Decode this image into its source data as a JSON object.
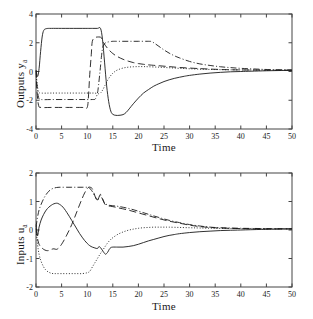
{
  "figure": {
    "background": "#ffffff",
    "line_color": "#1a1a1a",
    "axis_color": "#444444"
  },
  "chart_data": [
    {
      "type": "line",
      "id": "outputs",
      "title": "",
      "xlabel": "Time",
      "ylabel": "Outputs y",
      "ylabel_sub": "a",
      "xlim": [
        0,
        50
      ],
      "ylim": [
        -4,
        4
      ],
      "xticks": [
        0,
        5,
        10,
        15,
        20,
        25,
        30,
        35,
        40,
        45,
        50
      ],
      "yticks": [
        -4,
        -2,
        0,
        2,
        4
      ],
      "grid": false,
      "legend": "none",
      "series": [
        {
          "name": "output-1",
          "style": "solid",
          "x": [
            0,
            0.3,
            0.6,
            0.9,
            1.2,
            1.5,
            2,
            3,
            5,
            8,
            10,
            11,
            12,
            12.6,
            13,
            13.4,
            13.8,
            14.2,
            14.6,
            15,
            15.6,
            16.2,
            17,
            17.6,
            18.2,
            19,
            20,
            21,
            22,
            23,
            24,
            25,
            26,
            27,
            28,
            29,
            30,
            32,
            34,
            36,
            38,
            40,
            42,
            45,
            48,
            50
          ],
          "y": [
            0.1,
            -0.35,
            0.2,
            1.4,
            2.4,
            2.85,
            2.98,
            3.0,
            3.0,
            3.0,
            3.0,
            3.0,
            3.0,
            3.0,
            2.2,
            0.6,
            -1.0,
            -2.1,
            -2.75,
            -2.98,
            -3.05,
            -3.05,
            -3.0,
            -2.85,
            -2.6,
            -2.25,
            -1.85,
            -1.5,
            -1.25,
            -1.02,
            -0.85,
            -0.7,
            -0.58,
            -0.48,
            -0.4,
            -0.33,
            -0.27,
            -0.18,
            -0.11,
            -0.06,
            -0.02,
            0.0,
            0.02,
            0.05,
            0.07,
            0.08
          ]
        },
        {
          "name": "output-2",
          "style": "dashed",
          "x": [
            0,
            0.2,
            0.5,
            1,
            3,
            6,
            9,
            10,
            10.3,
            10.5,
            10.8,
            11,
            11.5,
            12,
            12.3,
            12.5,
            12.6,
            12.8,
            13.2,
            14,
            15,
            16,
            17,
            18,
            19,
            20,
            21,
            22,
            24,
            26,
            28,
            30,
            32,
            34,
            36,
            38,
            40,
            43,
            46,
            50
          ],
          "y": [
            0.05,
            -1.4,
            -2.35,
            -2.5,
            -2.5,
            -2.5,
            -2.5,
            -2.5,
            -1.4,
            -0.2,
            1.2,
            2.1,
            2.35,
            2.4,
            2.4,
            2.4,
            2.4,
            2.3,
            2.0,
            1.6,
            1.25,
            1.02,
            0.85,
            0.72,
            0.62,
            0.55,
            0.5,
            0.46,
            0.4,
            0.34,
            0.28,
            0.24,
            0.2,
            0.17,
            0.14,
            0.12,
            0.11,
            0.1,
            0.09,
            0.09
          ]
        },
        {
          "name": "output-3",
          "style": "dotted",
          "x": [
            0,
            0.2,
            0.5,
            1,
            3,
            6,
            9,
            10.5,
            11,
            11.4,
            11.8,
            12.2,
            12.6,
            13,
            13.5,
            14,
            14.5,
            15,
            15.5,
            16,
            17,
            18,
            19,
            20,
            21,
            22,
            24,
            26,
            28,
            30,
            33,
            36,
            40,
            45,
            50
          ],
          "y": [
            0.05,
            -0.8,
            -1.4,
            -1.5,
            -1.5,
            -1.5,
            -1.5,
            -1.5,
            -1.5,
            -1.5,
            -1.52,
            -1.55,
            -1.5,
            -1.3,
            -0.95,
            -0.6,
            -0.33,
            -0.12,
            0.02,
            0.12,
            0.24,
            0.3,
            0.33,
            0.34,
            0.34,
            0.33,
            0.3,
            0.26,
            0.22,
            0.19,
            0.15,
            0.13,
            0.11,
            0.1,
            0.09
          ]
        },
        {
          "name": "output-4",
          "style": "dashdot",
          "x": [
            0,
            0.2,
            0.5,
            1,
            3,
            6,
            9,
            11,
            11.6,
            12,
            12.2,
            12.5,
            12.8,
            13,
            13.2,
            13.6,
            14,
            14.6,
            15,
            16,
            18,
            20,
            22,
            22.6,
            23,
            24,
            25,
            26,
            27,
            28,
            30,
            32,
            34,
            36,
            38,
            40,
            43,
            46,
            50
          ],
          "y": [
            0.05,
            -1.0,
            -1.8,
            -1.95,
            -1.95,
            -1.95,
            -1.95,
            -1.95,
            -1.9,
            -1.5,
            -1.0,
            0.0,
            1.1,
            1.6,
            1.85,
            2.0,
            2.05,
            2.08,
            2.1,
            2.1,
            2.1,
            2.1,
            2.1,
            2.08,
            2.0,
            1.75,
            1.5,
            1.28,
            1.1,
            0.95,
            0.7,
            0.53,
            0.42,
            0.33,
            0.27,
            0.22,
            0.17,
            0.13,
            0.11
          ]
        }
      ]
    },
    {
      "type": "line",
      "id": "inputs",
      "title": "",
      "xlabel": "Time",
      "ylabel": "Inputs u",
      "ylabel_sub": "a",
      "xlim": [
        0,
        50
      ],
      "ylim": [
        -2,
        2
      ],
      "xticks": [
        0,
        5,
        10,
        15,
        20,
        25,
        30,
        35,
        40,
        45,
        50
      ],
      "yticks": [
        -2,
        -1,
        0,
        1,
        2
      ],
      "grid": false,
      "legend": "none",
      "series": [
        {
          "name": "input-1",
          "style": "solid",
          "x": [
            0,
            0.3,
            0.6,
            1,
            1.5,
            2,
            2.5,
            3,
            3.5,
            4,
            4.3,
            4.6,
            5,
            5.5,
            6,
            6.5,
            7,
            7.5,
            8,
            8.5,
            9,
            9.5,
            10,
            10.5,
            11,
            11.5,
            12,
            12.3,
            12.6,
            13,
            13.3,
            13.6,
            14,
            14.3,
            14.6,
            15,
            16,
            17,
            18,
            19,
            20,
            21,
            22,
            23,
            24,
            25,
            26,
            27,
            28,
            30,
            32,
            34,
            36,
            38,
            40,
            44,
            47,
            50
          ],
          "y": [
            0.2,
            -0.2,
            0.1,
            0.35,
            0.55,
            0.7,
            0.8,
            0.87,
            0.92,
            0.94,
            0.93,
            0.9,
            0.85,
            0.75,
            0.62,
            0.48,
            0.33,
            0.18,
            0.03,
            -0.12,
            -0.25,
            -0.37,
            -0.47,
            -0.55,
            -0.6,
            -0.63,
            -0.65,
            -0.58,
            -0.62,
            -0.72,
            -0.8,
            -0.85,
            -0.78,
            -0.68,
            -0.62,
            -0.6,
            -0.6,
            -0.6,
            -0.58,
            -0.55,
            -0.5,
            -0.44,
            -0.38,
            -0.33,
            -0.28,
            -0.23,
            -0.19,
            -0.16,
            -0.13,
            -0.09,
            -0.06,
            -0.04,
            -0.02,
            -0.01,
            0.0,
            0.02,
            0.03,
            0.04
          ]
        },
        {
          "name": "input-2",
          "style": "dashed",
          "x": [
            0,
            0.3,
            0.6,
            1,
            1.5,
            2,
            2.5,
            3,
            3.5,
            4,
            4.5,
            5,
            5.5,
            6,
            6.5,
            7,
            7.5,
            8,
            8.5,
            9,
            9.5,
            10,
            10.3,
            10.6,
            11,
            11.3,
            11.6,
            12,
            12.3,
            12.6,
            13,
            13.3,
            13.6,
            14,
            15,
            16,
            18,
            20,
            22,
            24,
            26,
            28,
            30,
            32,
            34,
            36,
            40,
            45,
            50
          ],
          "y": [
            0.05,
            -0.3,
            -0.5,
            -0.6,
            -0.68,
            -0.72,
            -0.72,
            -0.68,
            -0.66,
            -0.68,
            -0.62,
            -0.5,
            -0.35,
            -0.18,
            0.0,
            0.2,
            0.42,
            0.65,
            0.88,
            1.1,
            1.3,
            1.45,
            1.5,
            1.5,
            1.45,
            1.3,
            1.15,
            1.02,
            1.15,
            1.25,
            1.1,
            0.95,
            0.88,
            0.85,
            0.82,
            0.78,
            0.7,
            0.6,
            0.5,
            0.4,
            0.31,
            0.24,
            0.17,
            0.12,
            0.09,
            0.07,
            0.05,
            0.04,
            0.04
          ]
        },
        {
          "name": "input-3",
          "style": "dotted",
          "x": [
            0,
            0.3,
            0.6,
            1,
            1.5,
            2,
            2.5,
            3,
            3.5,
            4,
            5,
            6,
            7,
            8,
            9,
            10,
            10.5,
            11,
            11.5,
            12,
            12.5,
            13,
            13.5,
            14,
            14.5,
            15,
            16,
            17,
            18,
            19,
            20,
            21,
            22,
            23,
            24,
            25,
            26,
            28,
            30,
            32,
            35,
            40,
            45,
            50
          ],
          "y": [
            0.05,
            -0.5,
            -0.85,
            -1.1,
            -1.3,
            -1.42,
            -1.48,
            -1.52,
            -1.53,
            -1.53,
            -1.53,
            -1.53,
            -1.53,
            -1.53,
            -1.53,
            -1.5,
            -1.45,
            -1.3,
            -1.15,
            -1.0,
            -0.85,
            -0.72,
            -0.58,
            -0.45,
            -0.35,
            -0.27,
            -0.15,
            -0.07,
            -0.01,
            0.03,
            0.06,
            0.08,
            0.09,
            0.1,
            0.1,
            0.1,
            0.1,
            0.09,
            0.08,
            0.07,
            0.06,
            0.05,
            0.04,
            0.04
          ]
        },
        {
          "name": "input-4",
          "style": "dashdot",
          "x": [
            0,
            0.3,
            0.6,
            1,
            1.5,
            2,
            2.5,
            3,
            3.5,
            4,
            4.5,
            5,
            6,
            7,
            8,
            9,
            10,
            10.4,
            10.8,
            11,
            11.4,
            11.8,
            12,
            12.3,
            12.6,
            13,
            13.4,
            14,
            15,
            16,
            18,
            20,
            22,
            24,
            26,
            28,
            30,
            32,
            34,
            36,
            40,
            45,
            50
          ],
          "y": [
            0.1,
            0.45,
            0.7,
            0.9,
            1.1,
            1.25,
            1.36,
            1.43,
            1.47,
            1.49,
            1.5,
            1.5,
            1.5,
            1.5,
            1.5,
            1.5,
            1.5,
            1.48,
            1.4,
            1.35,
            1.22,
            1.1,
            1.05,
            1.15,
            1.2,
            1.08,
            0.95,
            0.88,
            0.85,
            0.83,
            0.76,
            0.66,
            0.55,
            0.44,
            0.34,
            0.26,
            0.19,
            0.14,
            0.1,
            0.08,
            0.06,
            0.05,
            0.04
          ]
        }
      ]
    }
  ]
}
